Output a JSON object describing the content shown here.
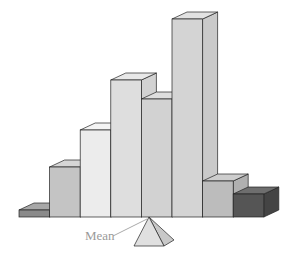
{
  "title": "",
  "annotation": {
    "mean_label": "Mean"
  },
  "chart_data": {
    "type": "bar",
    "title": "",
    "xlabel": "",
    "ylabel": "",
    "style": "3d-histogram-balanced-on-fulcrum",
    "categories": [
      "1",
      "2",
      "3",
      "4",
      "5",
      "6",
      "7",
      "8"
    ],
    "values": [
      7,
      50,
      87,
      137,
      118,
      198,
      36,
      23
    ],
    "annotations": [
      {
        "text": "Mean",
        "points_to": "fulcrum apex under bar 5 (left edge)"
      }
    ],
    "grid": false,
    "legend": null
  },
  "geometry": {
    "baseline_y": 217,
    "bar_left": 19,
    "bar_width": 30.6,
    "depth_dx": 15,
    "depth_dy": -7,
    "fulcrum": {
      "apex_x": 149,
      "apex_y": 217,
      "base_y": 246,
      "half_width": 15
    }
  },
  "colors": {
    "outline": "#222222",
    "fronts": [
      "#8a8a8a",
      "#c4c4c4",
      "#ececec",
      "#dedede",
      "#d2d2d2",
      "#d4d4d4",
      "#bcbcbc",
      "#555555"
    ],
    "tops": [
      "#a8a8a8",
      "#d6d6d6",
      "#f4f4f4",
      "#e8e8e8",
      "#dedede",
      "#e2e2e2",
      "#cdcdcd",
      "#6e6e6e"
    ],
    "sides": [
      "#7a7a7a",
      "#b8b8b8",
      "#e0e0e0",
      "#d2d2d2",
      "#c6c6c6",
      "#cacaca",
      "#b0b0b0",
      "#444444"
    ],
    "fulcrum_front": "#e0e0e0",
    "fulcrum_side": "#c8c8c8",
    "pointer": "#aaaaaa"
  }
}
